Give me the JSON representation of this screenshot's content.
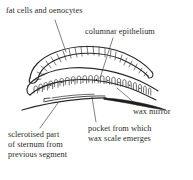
{
  "figure": {
    "background_color": "#ffffff",
    "ink_color": "#2b2b2b",
    "labels": [
      {
        "id": "fat_cells",
        "text": "fat cells and oenocytes",
        "lines": [
          "fat cells and oenocytes"
        ]
      },
      {
        "id": "columnar_epithelium",
        "text": "columnar epithelium",
        "lines": [
          "columnar epithelium"
        ]
      },
      {
        "id": "wax_mirror",
        "text": "wax mirror",
        "lines": [
          "wax mirror"
        ]
      },
      {
        "id": "pocket",
        "text": "pocket from which wax scale emerges",
        "lines": [
          "pocket from which",
          "wax scale emerges"
        ]
      },
      {
        "id": "sclerotised",
        "text": "sclerotised part of sternum from previous segment",
        "lines": [
          "sclerotised part",
          "of sternum from",
          "previous segment"
        ]
      }
    ],
    "structures": [
      {
        "id": "fat-body-layer",
        "name": "fat cells and oenocytes layer",
        "description": "hatched arched band at top"
      },
      {
        "id": "columnar-cell-layer",
        "name": "columnar epithelium layer",
        "description": "row of arch-shaped cells with nuclei"
      },
      {
        "id": "wax-mirror-plate",
        "name": "wax mirror",
        "description": "dark tapering wedge at right"
      },
      {
        "id": "sternum-baseline",
        "name": "sternum of previous segment",
        "description": "long thin curve beneath cell layer"
      },
      {
        "id": "wax-pocket",
        "name": "wax pocket",
        "description": "gap between sternum and cell layer"
      }
    ]
  }
}
